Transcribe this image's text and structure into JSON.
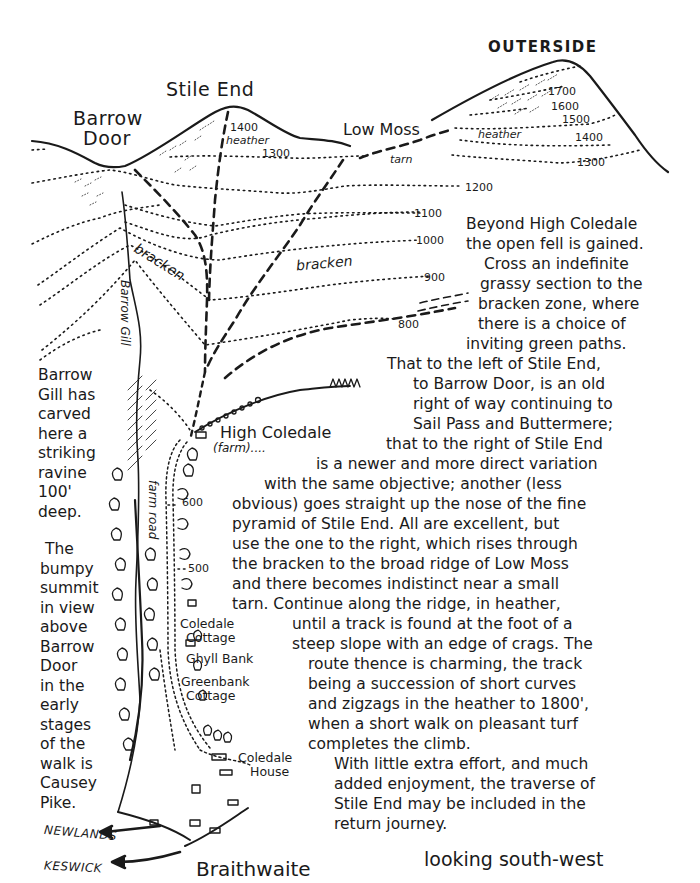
{
  "peaks": {
    "stile_end": "Stile End",
    "barrow_door_line1": "Barrow",
    "barrow_door_line2": "Door",
    "outerside": "OUTERSIDE",
    "low_moss": "Low Moss"
  },
  "terrain_labels": {
    "heather_stile": "heather",
    "heather_outerside": "heather",
    "tarn": "tarn",
    "bracken_left": "bracken",
    "bracken_right": "bracken",
    "barrow_gill": "Barrow Gill",
    "farm_road": "farm road"
  },
  "contours": {
    "stile_1400": "1400",
    "stile_1300": "1300",
    "out_1700": "1700",
    "out_1600": "1600",
    "out_1500": "1500",
    "out_1400": "1400",
    "out_1300": "1300",
    "c1200": "1200",
    "c1100": "1100",
    "c1000": "1000",
    "c900": "900",
    "c800": "800",
    "c600": "600",
    "c500": "500"
  },
  "places": {
    "high_coledale": "High Coledale",
    "high_coledale_note": "(farm)....",
    "coledale_cottage_1": "Coledale",
    "coledale_cottage_2": "Cottage",
    "ghyll_bank": "Ghyll Bank",
    "greenbank_1": "Greenbank",
    "greenbank_2": "Cottage",
    "coledale_house_1": "Coledale",
    "coledale_house_2": "House",
    "newlands": "NEWLANDS",
    "keswick": "KESWICK",
    "braithwaite": "Braithwaite"
  },
  "side_note_ravine": [
    "Barrow",
    "Gill has",
    "carved",
    "here a",
    "striking",
    "ravine",
    "100'",
    "deep."
  ],
  "side_note_summit": [
    "The",
    "bumpy",
    "summit",
    "in view",
    "above",
    "Barrow",
    "Door",
    "in the",
    "early",
    "stages",
    "of the",
    "walk is",
    "Causey",
    "Pike."
  ],
  "description": [
    "Beyond High Coledale",
    "the open fell is gained.",
    "Cross an indefinite",
    "grassy section to the",
    "bracken zone, where",
    "there is a choice of",
    "inviting green paths.",
    "That to the left of Stile End,",
    "to Barrow Door, is an old",
    "right of way continuing to",
    "Sail Pass and Buttermere;",
    "that to the right of Stile End",
    "is a newer and more direct variation",
    "with the same objective; another (less",
    "obvious) goes straight up the nose of the fine",
    "pyramid of Stile End. All are excellent, but",
    "use the one to the right, which rises through",
    "the bracken to the broad ridge of Low Moss",
    "and there becomes indistinct near a small",
    "tarn. Continue along the ridge, in heather,",
    "until a track is found at the foot of a",
    "steep slope with an edge of crags. The",
    "route thence is charming, the track",
    "being a succession of short curves",
    "and zigzags in the heather to 1800',",
    "when a short walk on pleasant turf",
    "completes the climb.",
    "With little extra effort, and much",
    "added enjoyment, the traverse of",
    "Stile End may be included in the",
    "return journey."
  ],
  "orientation": "looking south-west"
}
